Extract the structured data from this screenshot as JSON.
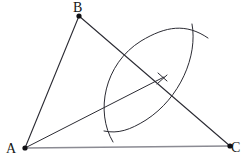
{
  "figure": {
    "width": 246,
    "height": 167,
    "background_color": "#ffffff"
  },
  "labels": {
    "a": "A",
    "b": "B",
    "c": "C"
  },
  "colors": {
    "stroke_dark": "#2b2b33",
    "stroke_light": "#8b8b93",
    "vertex_dot": "#101014",
    "background": "#ffffff"
  },
  "vertices": {
    "A": {
      "x": 25,
      "y": 148
    },
    "B": {
      "x": 79,
      "y": 16
    },
    "C": {
      "x": 230,
      "y": 146
    }
  },
  "segments": [
    {
      "name": "side-AB",
      "from": "A",
      "to": "B",
      "x1": 25,
      "y1": 148,
      "x2": 79,
      "y2": 16,
      "color": "#2b2b33",
      "width": 1.1
    },
    {
      "name": "side-BC",
      "from": "B",
      "to": "C",
      "x1": 79,
      "y1": 16,
      "x2": 230,
      "y2": 146,
      "color": "#2b2b33",
      "width": 1.1
    },
    {
      "name": "side-AC",
      "from": "A",
      "to": "C",
      "x1": 25,
      "y1": 148,
      "x2": 230,
      "y2": 146,
      "color": "#8b8b93",
      "width": 1.3
    },
    {
      "name": "angle-bisector-ray",
      "from": "A",
      "to": "bisector-endpoint",
      "x1": 25,
      "y1": 148,
      "x2": 164,
      "y2": 77,
      "color": "#2b2b33",
      "width": 1.0
    }
  ],
  "arcs": [
    {
      "name": "construction-arc-left",
      "path": "M 113 142 C 95 112, 104 64, 141 41 C 166 26, 186 23, 208 38",
      "color": "#2b2b33",
      "width": 1.0
    },
    {
      "name": "construction-arc-right",
      "path": "M 192 24 C 198 56, 180 98, 146 120 C 130 130, 118 134, 104 131",
      "color": "#2b2b33",
      "width": 1.0
    }
  ],
  "tick_marks": [
    {
      "name": "bisector-arrow-tick-upper",
      "x1": 159,
      "y1": 74,
      "x2": 167,
      "y2": 82,
      "color": "#2b2b33",
      "width": 1.0
    },
    {
      "name": "bisector-arrow-tick-lower",
      "x1": 166,
      "y1": 76,
      "x2": 158,
      "y2": 84,
      "color": "#2b2b33",
      "width": 1.0
    }
  ],
  "intersection_points": [
    {
      "name": "upper-arc-intersection",
      "x": 194,
      "y": 40
    },
    {
      "name": "lower-arc-intersection",
      "x": 115,
      "y": 128
    },
    {
      "name": "bisector-meets-BC",
      "x": 166,
      "y": 91
    }
  ]
}
